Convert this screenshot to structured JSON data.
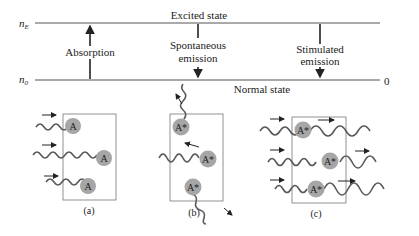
{
  "energy_levels": {
    "upper": {
      "symbol": "n",
      "subscript": "E",
      "label": "Excited state"
    },
    "lower": {
      "symbol": "n",
      "subscript": "0",
      "label": "Normal state",
      "value": "0"
    }
  },
  "transitions": [
    {
      "label": "Absorption",
      "direction": "up"
    },
    {
      "label_line1": "Spontaneous",
      "label_line2": "emission",
      "direction": "down"
    },
    {
      "label_line1": "Stimulated",
      "label_line2": "emission",
      "direction": "down"
    }
  ],
  "panels": [
    {
      "caption": "(a)",
      "atoms": [
        "A",
        "A",
        "A"
      ]
    },
    {
      "caption": "(b)",
      "atoms": [
        "A*",
        "A*",
        "A*"
      ]
    },
    {
      "caption": "(c)",
      "atoms": [
        "A*",
        "A*",
        "A*"
      ]
    }
  ],
  "colors": {
    "line": "#555555",
    "atom": "#a6a6a6",
    "wave": "#5a5a5a",
    "box": "#777777",
    "text": "#222222"
  }
}
